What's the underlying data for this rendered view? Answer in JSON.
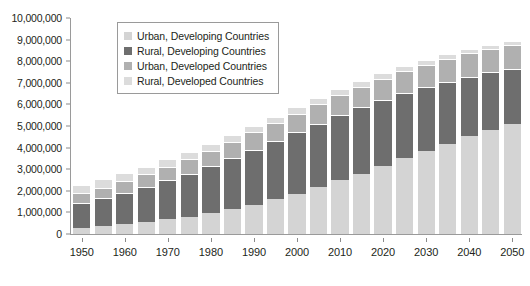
{
  "chart_data": {
    "type": "bar",
    "stacked": true,
    "title": "",
    "subtitle": "",
    "xlabel": "",
    "ylabel": "",
    "ylim": [
      0,
      10000000
    ],
    "ytick_step": 1000000,
    "grid": false,
    "legend_position": "top-left-inside",
    "y_tick_labels": [
      "0",
      "1,000,000",
      "2,000,000",
      "3,000,000",
      "4,000,000",
      "5,000,000",
      "6,000,000",
      "7,000,000",
      "8,000,000",
      "9,000,000",
      "10,000,000"
    ],
    "y_tick_values": [
      0,
      1000000,
      2000000,
      3000000,
      4000000,
      5000000,
      6000000,
      7000000,
      8000000,
      9000000,
      10000000
    ],
    "x_tick_labels": [
      "1950",
      "1960",
      "1970",
      "1980",
      "1990",
      "2000",
      "2010",
      "2020",
      "2030",
      "2040",
      "2050"
    ],
    "categories": [
      "1950",
      "1955",
      "1960",
      "1965",
      "1970",
      "1975",
      "1980",
      "1985",
      "1990",
      "1995",
      "2000",
      "2005",
      "2010",
      "2015",
      "2020",
      "2025",
      "2030",
      "2035",
      "2040",
      "2045",
      "2050"
    ],
    "series": [
      {
        "name": "Urban, Developing Countries",
        "color": "#d4d4d4",
        "values": [
          300000,
          360000,
          450000,
          550000,
          680000,
          810000,
          970000,
          1150000,
          1360000,
          1600000,
          1870000,
          2160000,
          2480000,
          2800000,
          3150000,
          3500000,
          3850000,
          4190000,
          4520000,
          4820000,
          5100000
        ]
      },
      {
        "name": "Rural, Developing Countries",
        "color": "#6e6e6e",
        "values": [
          1150000,
          1300000,
          1450000,
          1620000,
          1800000,
          1980000,
          2160000,
          2360000,
          2540000,
          2700000,
          2830000,
          2940000,
          3020000,
          3060000,
          3060000,
          3030000,
          2960000,
          2870000,
          2770000,
          2660000,
          2540000
        ]
      },
      {
        "name": "Urban, Developed Countries",
        "color": "#b0b0b0",
        "values": [
          440000,
          490000,
          540000,
          590000,
          640000,
          690000,
          730000,
          770000,
          810000,
          840000,
          870000,
          900000,
          930000,
          960000,
          990000,
          1010000,
          1030000,
          1050000,
          1070000,
          1080000,
          1090000
        ]
      },
      {
        "name": "Rural, Developed Countries",
        "color": "#dcdcdc",
        "values": [
          390000,
          380000,
          370000,
          360000,
          350000,
          340000,
          330000,
          320000,
          310000,
          300000,
          290000,
          280000,
          270000,
          260000,
          250000,
          240000,
          230000,
          220000,
          210000,
          200000,
          190000
        ]
      }
    ],
    "totals": [
      2280000,
      2530000,
      2810000,
      3120000,
      3470000,
      3820000,
      4190000,
      4600000,
      5020000,
      5440000,
      5860000,
      6280000,
      6700000,
      7080000,
      7450000,
      7780000,
      8070000,
      8330000,
      8570000,
      8760000,
      8920000
    ]
  },
  "legend": {
    "items": [
      {
        "label": "Urban, Developing Countries",
        "color": "#d4d4d4"
      },
      {
        "label": "Rural, Developing Countries",
        "color": "#6e6e6e"
      },
      {
        "label": "Urban, Developed Countries",
        "color": "#b0b0b0"
      },
      {
        "label": "Rural, Developed Countries",
        "color": "#dcdcdc"
      }
    ]
  },
  "axis_colors": {
    "line": "#9a9a9a",
    "text": "#231f20"
  }
}
